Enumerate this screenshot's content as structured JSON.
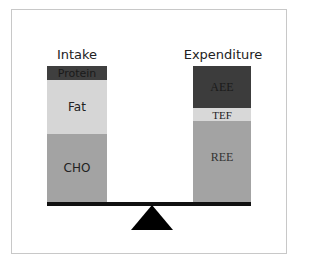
{
  "diagram": {
    "type": "energy-balance-scale",
    "left": {
      "title": "Intake",
      "segments": [
        {
          "label": "Protein",
          "color": "#3f3f3f",
          "text_color": "#1a1a1a"
        },
        {
          "label": "Fat",
          "color": "#d6d6d6",
          "text_color": "#222222"
        },
        {
          "label": "CHO",
          "color": "#a3a3a3",
          "text_color": "#222222"
        }
      ]
    },
    "right": {
      "title": "Expenditure",
      "segments": [
        {
          "label": "AEE",
          "color": "#3c3c3c",
          "text_color": "#1a1a1a"
        },
        {
          "label": "TEF",
          "color": "#d8d8d8",
          "text_color": "#222222"
        },
        {
          "label": "REE",
          "color": "#a3a3a3",
          "text_color": "#333333"
        }
      ]
    },
    "beam_color": "#111111",
    "fulcrum_color": "#000000"
  }
}
